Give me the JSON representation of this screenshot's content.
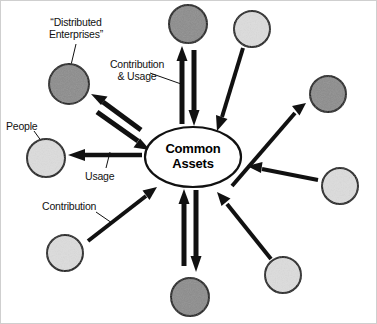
{
  "diagram": {
    "title_hub": {
      "line1": "Common",
      "line2": "Assets",
      "cx": 193,
      "cy": 157,
      "rx": 48,
      "ry": 30
    },
    "labels": [
      {
        "name": "distributed-enterprises-label",
        "text": "“Distributed\nEnterprises”",
        "x": 36,
        "y": 16,
        "w": 80,
        "align": "center"
      },
      {
        "name": "contribution-and-usage-label",
        "text": "Contribution\n& Usage",
        "x": 100,
        "y": 58,
        "w": 74,
        "align": "center"
      },
      {
        "name": "people-label",
        "text": "People",
        "x": 6,
        "y": 120,
        "w": 44,
        "align": "left"
      },
      {
        "name": "usage-label",
        "text": "Usage",
        "x": 85,
        "y": 170,
        "w": 40,
        "align": "left"
      },
      {
        "name": "contribution-label",
        "text": "Contribution",
        "x": 42,
        "y": 200,
        "w": 70,
        "align": "left"
      }
    ],
    "nodes": [
      {
        "name": "node-enterprise-top",
        "kind": "enterprise",
        "cx": 188,
        "cy": 24,
        "r": 19,
        "fill": "#8c8c8c"
      },
      {
        "name": "node-people-top-right",
        "kind": "people",
        "cx": 252,
        "cy": 29,
        "r": 18,
        "fill": "#dcdcdc"
      },
      {
        "name": "node-enterprise-right",
        "kind": "enterprise",
        "cx": 328,
        "cy": 94,
        "r": 18,
        "fill": "#8c8c8c"
      },
      {
        "name": "node-people-right",
        "kind": "people",
        "cx": 340,
        "cy": 186,
        "r": 18,
        "fill": "#dcdcdc"
      },
      {
        "name": "node-people-bottom-right",
        "kind": "people",
        "cx": 283,
        "cy": 275,
        "r": 18,
        "fill": "#dcdcdc"
      },
      {
        "name": "node-enterprise-bottom",
        "kind": "enterprise",
        "cx": 190,
        "cy": 297,
        "r": 19,
        "fill": "#8c8c8c"
      },
      {
        "name": "node-people-bottom-left",
        "kind": "people",
        "cx": 65,
        "cy": 253,
        "r": 18,
        "fill": "#dcdcdc"
      },
      {
        "name": "node-people-left",
        "kind": "people",
        "cx": 46,
        "cy": 158,
        "r": 19,
        "fill": "#dcdcdc"
      },
      {
        "name": "node-enterprise-top-left",
        "kind": "enterprise",
        "cx": 69,
        "cy": 84,
        "r": 20,
        "fill": "#8c8c8c"
      }
    ],
    "connectors": [
      {
        "name": "arrow-hub-to-enterprise-top",
        "direction": "bidirectional",
        "from": "hub",
        "to": "node-enterprise-top"
      },
      {
        "name": "arrow-people-top-right-to-hub",
        "direction": "inbound",
        "from": "node-people-top-right",
        "to": "hub"
      },
      {
        "name": "arrow-hub-to-enterprise-right",
        "direction": "outbound",
        "from": "hub",
        "to": "node-enterprise-right"
      },
      {
        "name": "arrow-people-right-to-hub",
        "direction": "inbound",
        "from": "node-people-right",
        "to": "hub"
      },
      {
        "name": "arrow-people-bottom-right-to-hub",
        "direction": "inbound",
        "from": "node-people-bottom-right",
        "to": "hub"
      },
      {
        "name": "arrow-hub-to-enterprise-bottom",
        "direction": "bidirectional",
        "from": "hub",
        "to": "node-enterprise-bottom"
      },
      {
        "name": "arrow-people-bottom-left-to-hub",
        "direction": "inbound",
        "from": "node-people-bottom-left",
        "to": "hub"
      },
      {
        "name": "arrow-hub-to-people-left",
        "direction": "outbound",
        "from": "hub",
        "to": "node-people-left"
      },
      {
        "name": "arrow-hub-to-enterprise-top-left",
        "direction": "bidirectional",
        "from": "hub",
        "to": "node-enterprise-top-left"
      }
    ],
    "colors": {
      "enterprise_fill": "#8c8c8c",
      "people_fill": "#dcdcdc",
      "stroke": "#111111",
      "background": "#ffffff",
      "text": "#111111"
    }
  }
}
